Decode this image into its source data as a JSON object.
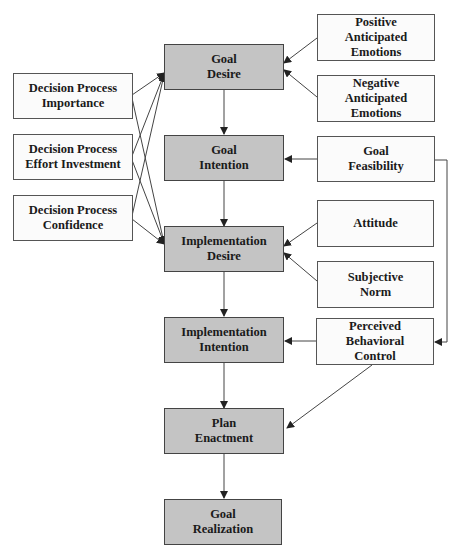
{
  "diagram": {
    "type": "flowchart",
    "colors": {
      "core_box": "#c4c4c4",
      "input_box": "#fbfbfb",
      "border": "#555555",
      "arrow": "#333333"
    },
    "core_nodes": [
      {
        "id": "goal_desire",
        "label": "Goal\nDesire"
      },
      {
        "id": "goal_intention",
        "label": "Goal\nIntention"
      },
      {
        "id": "implementation_desire",
        "label": "Implementation\nDesire"
      },
      {
        "id": "implementation_intention",
        "label": "Implementation\nIntention"
      },
      {
        "id": "plan_enactment",
        "label": "Plan\nEnactment"
      },
      {
        "id": "goal_realization",
        "label": "Goal\nRealization"
      }
    ],
    "left_nodes": [
      {
        "id": "dp_importance",
        "label": "Decision Process\nImportance"
      },
      {
        "id": "dp_effort",
        "label": "Decision Process\nEffort Investment"
      },
      {
        "id": "dp_confidence",
        "label": "Decision Process\nConfidence"
      }
    ],
    "right_nodes": [
      {
        "id": "positive_emotions",
        "label": "Positive\nAnticipated\nEmotions"
      },
      {
        "id": "negative_emotions",
        "label": "Negative\nAnticipated\nEmotions"
      },
      {
        "id": "goal_feasibility",
        "label": "Goal\nFeasibility"
      },
      {
        "id": "attitude",
        "label": "Attitude"
      },
      {
        "id": "subjective_norm",
        "label": "Subjective\nNorm"
      },
      {
        "id": "pbc",
        "label": "Perceived\nBehavioral\nControl"
      }
    ],
    "edges": [
      [
        "goal_desire",
        "goal_intention"
      ],
      [
        "goal_intention",
        "implementation_desire"
      ],
      [
        "implementation_desire",
        "implementation_intention"
      ],
      [
        "implementation_intention",
        "plan_enactment"
      ],
      [
        "plan_enactment",
        "goal_realization"
      ],
      [
        "dp_importance",
        "goal_desire"
      ],
      [
        "dp_importance",
        "implementation_desire"
      ],
      [
        "dp_effort",
        "goal_desire"
      ],
      [
        "dp_effort",
        "implementation_desire"
      ],
      [
        "dp_confidence",
        "goal_desire"
      ],
      [
        "dp_confidence",
        "implementation_desire"
      ],
      [
        "positive_emotions",
        "goal_desire"
      ],
      [
        "negative_emotions",
        "goal_desire"
      ],
      [
        "goal_feasibility",
        "goal_intention"
      ],
      [
        "goal_feasibility",
        "pbc"
      ],
      [
        "attitude",
        "implementation_desire"
      ],
      [
        "subjective_norm",
        "implementation_desire"
      ],
      [
        "pbc",
        "implementation_intention"
      ],
      [
        "pbc",
        "plan_enactment"
      ]
    ]
  }
}
